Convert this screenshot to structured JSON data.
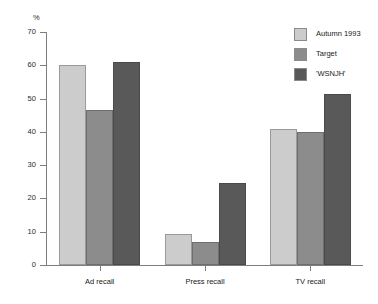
{
  "chart_data": {
    "type": "bar",
    "title": "",
    "subtitle": "",
    "xlabel": "",
    "ylabel": "%",
    "ylim": [
      0,
      70
    ],
    "ytick_labels": [
      "0",
      "10",
      "20",
      "30",
      "40",
      "50",
      "60",
      "70"
    ],
    "ytick_values": [
      0,
      10,
      20,
      30,
      40,
      50,
      60,
      70
    ],
    "grid": false,
    "legend_position": "top-right",
    "categories": [
      "Ad recall",
      "Press recall",
      "TV recall"
    ],
    "series": [
      {
        "name": "Autumn 1993",
        "color": "#cccccc",
        "values": [
          60,
          9.3,
          41
        ]
      },
      {
        "name": "Target",
        "color": "#8c8c8c",
        "values": [
          46.7,
          7,
          40
        ]
      },
      {
        "name": "'WSNJH'",
        "color": "#595959",
        "values": [
          61,
          24.7,
          51.5
        ]
      }
    ]
  }
}
